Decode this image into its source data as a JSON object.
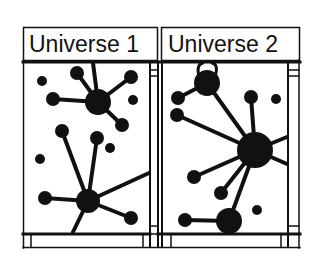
{
  "panels": [
    {
      "id": "universe-1",
      "title": "Universe 1"
    },
    {
      "id": "universe-2",
      "title": "Universe 2"
    }
  ],
  "colors": {
    "ink": "#111111",
    "paper": "#ffffff"
  },
  "diagram": {
    "universe_1": {
      "hubs": [
        {
          "x": 98,
          "y": 102,
          "r": 11,
          "spokes": [
            [
              77,
              73
            ],
            [
              93,
              62
            ],
            [
              131,
              77
            ],
            [
              53,
              99
            ],
            [
              122,
              125
            ]
          ]
        },
        {
          "x": 88,
          "y": 201,
          "r": 10,
          "spokes": [
            [
              62,
              130
            ],
            [
              97,
              138
            ],
            [
              45,
              198
            ],
            [
              131,
              218
            ],
            [
              150,
              173
            ],
            [
              72,
              232
            ]
          ]
        }
      ],
      "isolated": [
        [
          42,
          81
        ],
        [
          133,
          100
        ],
        [
          40,
          159
        ],
        [
          110,
          148
        ]
      ]
    },
    "universe_2": {
      "hubs": [
        {
          "x": 207,
          "y": 83,
          "r": 11,
          "spokes": [
            [
              178,
              98
            ],
            [
              255,
              150
            ]
          ]
        },
        {
          "x": 255,
          "y": 150,
          "r": 16,
          "spokes": [
            [
              177,
              115
            ],
            [
              251,
              97
            ],
            [
              194,
              177
            ],
            [
              221,
              193
            ],
            [
              229,
              221
            ],
            [
              288,
              136
            ],
            [
              288,
              162
            ]
          ]
        },
        {
          "x": 229,
          "y": 221,
          "r": 11,
          "spokes": [
            [
              185,
              220
            ]
          ]
        }
      ],
      "isolated": [
        [
          276,
          99
        ],
        [
          257,
          210
        ]
      ]
    }
  }
}
